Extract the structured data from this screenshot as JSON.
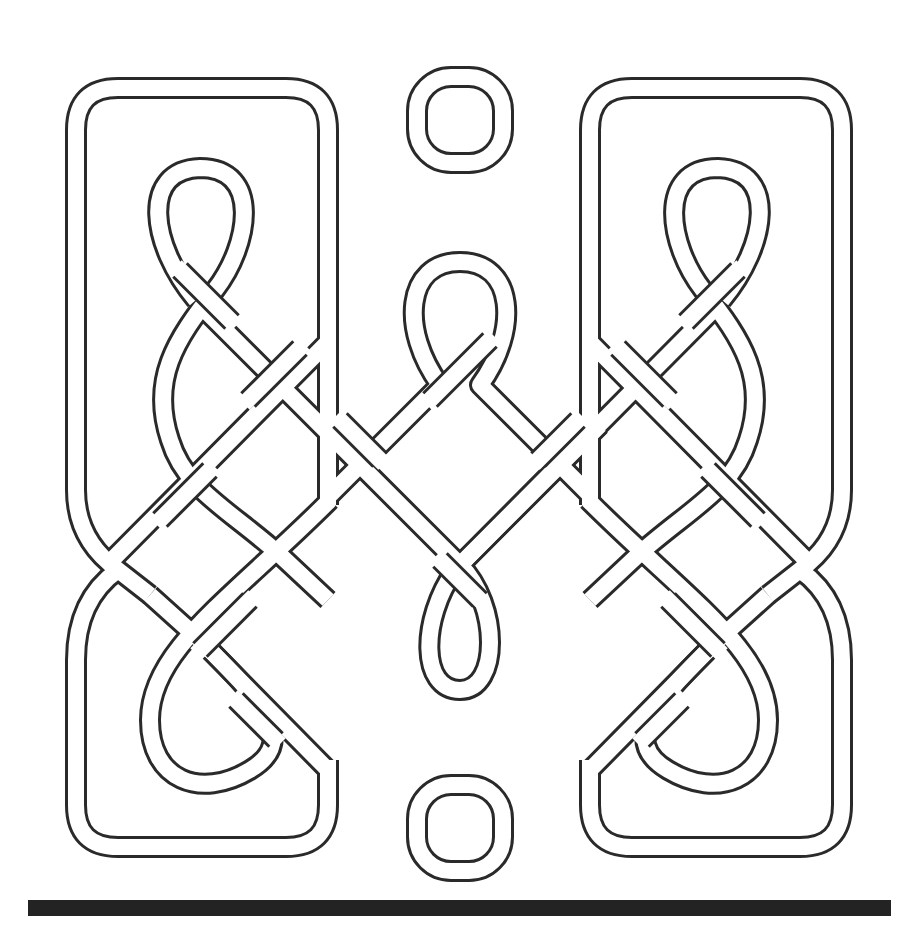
{
  "figure": {
    "colors": {
      "background": "#ffffff",
      "line": "#2a2a2a",
      "band_fill": "#ffffff",
      "bar": "#232323"
    },
    "band": {
      "outer_width": 22,
      "inner_width": 16
    },
    "elements": [
      "left-panel-knot",
      "right-panel-knot",
      "top-ring",
      "bottom-ring",
      "upper-center-loop",
      "lower-center-loop",
      "baseline-bar"
    ]
  }
}
